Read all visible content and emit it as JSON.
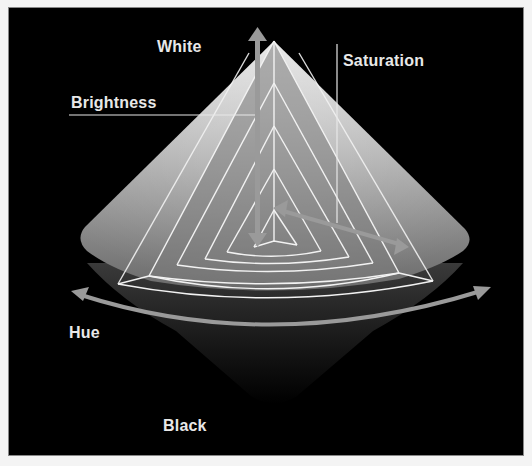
{
  "diagram": {
    "labels": {
      "white": "White",
      "brightness": "Brightness",
      "saturation": "Saturation",
      "hue": "Hue",
      "black": "Black"
    },
    "colors": {
      "background": "#000000",
      "cone_light": "#d8d8d8",
      "cone_mid": "#8a8a8a",
      "cone_dark": "#2a2a2a",
      "lines": "#f0f0f0",
      "arrows": "#9a9a9a",
      "text": "#e8e8e8"
    }
  }
}
